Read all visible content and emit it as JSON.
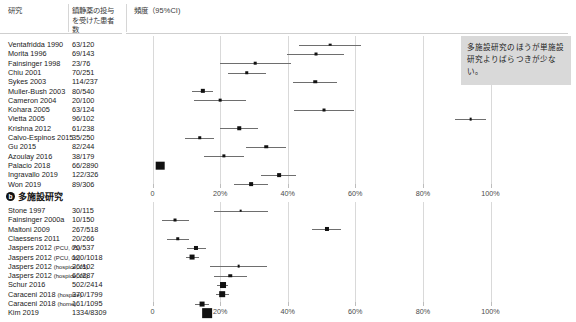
{
  "header": {
    "col_study": "研究",
    "col_patients": "鎮静薬の投与を受けた患者数",
    "col_frequency": "頻度（95%CI)"
  },
  "callout": {
    "text": "多施設研究のほうが単施設研究よりばらつきが少ない。"
  },
  "axis": {
    "ticks": [
      "0",
      "20%",
      "40%",
      "60%",
      "80%",
      "100%"
    ],
    "tick_values": [
      0,
      20,
      40,
      60,
      80,
      100
    ],
    "min": 0,
    "max": 108
  },
  "chart_data": {
    "type": "forest",
    "xlabel": "頻度（95%CI)",
    "ylabel": "研究",
    "xlim": [
      0,
      108
    ],
    "xticks": [
      0,
      20,
      40,
      60,
      80,
      100
    ],
    "xticklabels": [
      "0",
      "20%",
      "40%",
      "60%",
      "80%",
      "100%"
    ],
    "grid": true,
    "panels": [
      {
        "id": "a",
        "label": "単施設研究",
        "label_marker": "a",
        "studies": [
          {
            "name": "Ventafridda 1990",
            "n": "63/120",
            "estimate": 52.5,
            "ci_low": 43.4,
            "ci_high": 61.6,
            "weight": 1.0
          },
          {
            "name": "Morita 1996",
            "n": "69/143",
            "estimate": 48.3,
            "ci_low": 39.9,
            "ci_high": 56.7,
            "weight": 1.1
          },
          {
            "name": "Fainsinger 1998",
            "n": "23/76",
            "estimate": 30.3,
            "ci_low": 20.0,
            "ci_high": 41.0,
            "weight": 0.8
          },
          {
            "name": "Chiu 2001",
            "n": "70/251",
            "estimate": 27.9,
            "ci_low": 22.3,
            "ci_high": 33.5,
            "weight": 1.3
          },
          {
            "name": "Sykes 2003",
            "n": "114/237",
            "estimate": 48.1,
            "ci_low": 41.7,
            "ci_high": 54.5,
            "weight": 1.3
          },
          {
            "name": "Muller-Bush 2003",
            "n": "80/540",
            "estimate": 14.8,
            "ci_low": 11.8,
            "ci_high": 17.8,
            "weight": 1.6
          },
          {
            "name": "Cameron 2004",
            "n": "20/100",
            "estimate": 20.0,
            "ci_low": 12.2,
            "ci_high": 27.8,
            "weight": 1.0
          },
          {
            "name": "Kohara 2005",
            "n": "63/124",
            "estimate": 50.8,
            "ci_low": 42.0,
            "ci_high": 59.6,
            "weight": 1.1
          },
          {
            "name": "Vietta 2005",
            "n": "96/102",
            "estimate": 94.1,
            "ci_low": 89.5,
            "ci_high": 98.7,
            "weight": 1.0
          },
          {
            "name": "Krishna 2012",
            "n": "61/238",
            "estimate": 25.6,
            "ci_low": 20.1,
            "ci_high": 31.1,
            "weight": 1.3
          },
          {
            "name": "Calvo-Espinos 2015",
            "n": "35/250",
            "estimate": 14.0,
            "ci_low": 9.7,
            "ci_high": 18.3,
            "weight": 1.3
          },
          {
            "name": "Gu 2015",
            "n": "82/244",
            "estimate": 33.6,
            "ci_low": 27.7,
            "ci_high": 39.5,
            "weight": 1.3
          },
          {
            "name": "Azoulay 2016",
            "n": "38/179",
            "estimate": 21.2,
            "ci_low": 15.2,
            "ci_high": 27.2,
            "weight": 1.2
          },
          {
            "name": "Palacio 2018",
            "n": "66/2890",
            "estimate": 2.3,
            "ci_low": 1.7,
            "ci_high": 2.9,
            "weight": 3.2
          },
          {
            "name": "Ingravallo 2019",
            "n": "122/326",
            "estimate": 37.4,
            "ci_low": 32.2,
            "ci_high": 42.6,
            "weight": 1.4
          },
          {
            "name": "Won 2019",
            "n": "89/306",
            "estimate": 29.1,
            "ci_low": 24.0,
            "ci_high": 34.2,
            "weight": 1.4
          }
        ]
      },
      {
        "id": "b",
        "label": "多施設研究",
        "label_marker": "b",
        "studies": [
          {
            "name": "Stone 1997",
            "n": "30/115",
            "estimate": 26.1,
            "ci_low": 18.1,
            "ci_high": 34.1,
            "weight": 1.0
          },
          {
            "name": "Fainsinger 2000a",
            "n": "10/150",
            "estimate": 6.7,
            "ci_low": 2.7,
            "ci_high": 10.7,
            "weight": 1.1
          },
          {
            "name": "Maltoni 2009",
            "n": "267/518",
            "estimate": 51.5,
            "ci_low": 47.2,
            "ci_high": 55.8,
            "weight": 1.5
          },
          {
            "name": "Claessens 2011",
            "n": "20/266",
            "estimate": 7.5,
            "ci_low": 4.3,
            "ci_high": 10.7,
            "weight": 1.3
          },
          {
            "name": "Jaspers 2012 (PCU, 05)",
            "n": "70/537",
            "estimate": 13.0,
            "ci_low": 10.2,
            "ci_high": 15.8,
            "weight": 1.5
          },
          {
            "name": "Jaspers 2012 (PCU, 06)",
            "n": "120/1018",
            "estimate": 11.8,
            "ci_low": 9.8,
            "ci_high": 13.8,
            "weight": 1.8
          },
          {
            "name": "Jaspers 2012 (hospice, 05)",
            "n": "26/102",
            "estimate": 25.5,
            "ci_low": 17.0,
            "ci_high": 34.0,
            "weight": 1.0
          },
          {
            "name": "Jaspers 2012 (hospice, 06)",
            "n": "66/287",
            "estimate": 23.0,
            "ci_low": 18.1,
            "ci_high": 27.9,
            "weight": 1.3
          },
          {
            "name": "Schur 2016",
            "n": "502/2414",
            "estimate": 20.8,
            "ci_low": 19.2,
            "ci_high": 22.4,
            "weight": 2.2
          },
          {
            "name": "Caraceni 2018 (hospice)",
            "n": "370/1799",
            "estimate": 20.6,
            "ci_low": 18.7,
            "ci_high": 22.5,
            "weight": 2.1
          },
          {
            "name": "Caraceni 2018 (home)",
            "n": "161/1095",
            "estimate": 14.7,
            "ci_low": 12.6,
            "ci_high": 16.8,
            "weight": 1.8
          },
          {
            "name": "Kim 2019",
            "n": "1334/8309",
            "estimate": 16.1,
            "ci_low": 15.3,
            "ci_high": 16.9,
            "weight": 3.6
          }
        ]
      }
    ]
  }
}
